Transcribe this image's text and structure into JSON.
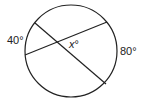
{
  "diagram": {
    "type": "circle-intersecting-chords",
    "labels": {
      "left_arc": "40°",
      "right_arc": "80°",
      "angle_var": "x",
      "angle_deg": "°"
    },
    "colors": {
      "stroke": "#222222",
      "background": "#ffffff"
    }
  }
}
